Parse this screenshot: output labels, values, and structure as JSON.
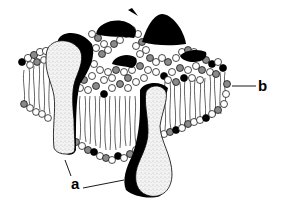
{
  "diagram": {
    "labels": [
      {
        "id": "a",
        "text": "a",
        "points_to": "integral proteins (two transmembrane proteins)"
      },
      {
        "id": "b",
        "text": "b",
        "points_to": "phospholipid bilayer"
      }
    ],
    "components": {
      "phospholipid_heads": "small circles, white / grey / black shaded",
      "fatty_acid_tails": "wavy vertical lines between layers",
      "proteins": [
        "left transmembrane protein (stippled, black-shaded side)",
        "front transmembrane protein (stippled, protrudes below)",
        "peripheral dark protein humps on top surface"
      ]
    },
    "colors": {
      "ink": "#000000",
      "background": "#ffffff",
      "stipple": "#e6e6e6",
      "grey_head": "#8a8a8a"
    }
  }
}
